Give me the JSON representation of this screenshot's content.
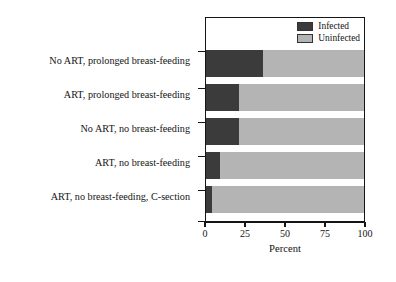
{
  "chart_data": {
    "type": "bar",
    "orientation": "horizontal",
    "stacked": true,
    "title": "",
    "subtitle": "",
    "xlabel": "Percent",
    "ylabel": "",
    "xlim": [
      0,
      100
    ],
    "xticks": [
      0,
      25,
      50,
      75,
      100
    ],
    "xticklabels": [
      "0",
      "25",
      "50",
      "75",
      "100"
    ],
    "grid": false,
    "legend_position": "top-right",
    "categories": [
      "No ART, prolonged breast-feeding",
      "ART, prolonged breast-feeding",
      "No ART, no breast-feeding",
      "ART, no breast-feeding",
      "ART, no breast-feeding, C-section"
    ],
    "series": [
      {
        "name": "Infected",
        "color": "#3b3b3b",
        "values": [
          36,
          21,
          21,
          9,
          4
        ]
      },
      {
        "name": "Uninfected",
        "color": "#b4b4b4",
        "values": [
          64,
          79,
          79,
          91,
          96
        ]
      }
    ]
  },
  "legend": {
    "items": [
      {
        "label": "Infected",
        "color": "#3b3b3b"
      },
      {
        "label": "Uninfected",
        "color": "#b4b4b4"
      }
    ]
  },
  "axis": {
    "x_title": "Percent"
  }
}
